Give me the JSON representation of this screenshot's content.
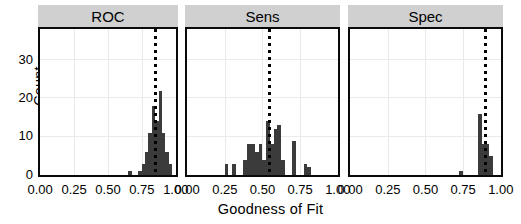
{
  "axes": {
    "ylabel": "Count",
    "xlabel": "Goodness of Fit",
    "y_ticks": [
      "0",
      "10",
      "20",
      "30"
    ],
    "x_ticks": [
      "0.00",
      "0.25",
      "0.50",
      "0.75",
      "1.00"
    ]
  },
  "facets": [
    {
      "label": "ROC"
    },
    {
      "label": "Sens"
    },
    {
      "label": "Spec"
    }
  ],
  "colors": {
    "bar": "#3b3b3b",
    "strip": "#d0d0d0",
    "panel_border": "#0a0a0a",
    "grid": "#eaeaea",
    "median_line": "#000000"
  },
  "chart_data": {
    "type": "bar",
    "title": "",
    "subtitle": "",
    "xlabel": "Goodness of Fit",
    "ylabel": "Count",
    "xlim": [
      0.0,
      1.0
    ],
    "ylim": [
      0,
      38
    ],
    "grid": true,
    "legend_position": "none",
    "facet_variable": "metric",
    "binwidth": 0.025,
    "annotations": [
      {
        "panel": "ROC",
        "type": "vertical-dotted-line",
        "x": 0.85
      },
      {
        "panel": "Sens",
        "type": "vertical-dotted-line",
        "x": 0.55
      },
      {
        "panel": "Spec",
        "type": "vertical-dotted-line",
        "x": 0.9
      }
    ],
    "panels": [
      {
        "name": "ROC",
        "bins": [
          {
            "x": 0.6625,
            "count": 1
          },
          {
            "x": 0.7375,
            "count": 1
          },
          {
            "x": 0.7625,
            "count": 3
          },
          {
            "x": 0.7875,
            "count": 6
          },
          {
            "x": 0.8125,
            "count": 11
          },
          {
            "x": 0.8375,
            "count": 18
          },
          {
            "x": 0.8625,
            "count": 14
          },
          {
            "x": 0.8875,
            "count": 22
          },
          {
            "x": 0.9125,
            "count": 11
          },
          {
            "x": 0.9375,
            "count": 6
          },
          {
            "x": 0.9625,
            "count": 3
          }
        ]
      },
      {
        "name": "Sens",
        "bins": [
          {
            "x": 0.2625,
            "count": 3
          },
          {
            "x": 0.3125,
            "count": 3
          },
          {
            "x": 0.3875,
            "count": 4
          },
          {
            "x": 0.4125,
            "count": 8
          },
          {
            "x": 0.4375,
            "count": 8
          },
          {
            "x": 0.4625,
            "count": 6
          },
          {
            "x": 0.4875,
            "count": 8
          },
          {
            "x": 0.5125,
            "count": 4
          },
          {
            "x": 0.5375,
            "count": 14
          },
          {
            "x": 0.5625,
            "count": 8
          },
          {
            "x": 0.5875,
            "count": 12
          },
          {
            "x": 0.6125,
            "count": 13
          },
          {
            "x": 0.6375,
            "count": 4
          },
          {
            "x": 0.7125,
            "count": 9
          },
          {
            "x": 0.7875,
            "count": 3
          },
          {
            "x": 0.8125,
            "count": 2
          }
        ]
      },
      {
        "name": "Spec",
        "bins": [
          {
            "x": 0.7375,
            "count": 1
          },
          {
            "x": 0.8625,
            "count": 16
          },
          {
            "x": 0.8875,
            "count": 8
          },
          {
            "x": 0.9125,
            "count": 8
          },
          {
            "x": 0.9375,
            "count": 5
          }
        ]
      }
    ]
  }
}
